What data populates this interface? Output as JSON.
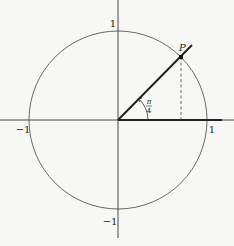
{
  "diagram": {
    "type": "unit-circle",
    "center": {
      "x": 118,
      "y": 120
    },
    "radius": 89,
    "colors": {
      "stroke": "#333333",
      "background": "#f7f7f5"
    },
    "axis_labels": {
      "x_positive": "1",
      "x_negative": "−1",
      "y_positive": "1",
      "y_negative": "−1"
    },
    "point": {
      "label": "P",
      "angle": "π/4"
    },
    "angle_label": {
      "numerator": "π",
      "denominator": "4"
    }
  }
}
